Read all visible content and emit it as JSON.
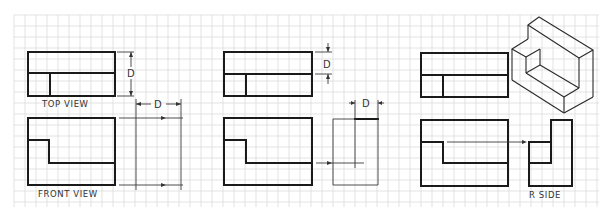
{
  "diagram": {
    "colors": {
      "line": "#1a1a1a",
      "thin_line": "#3a3a3a",
      "grid": "#dcdcdc",
      "background": "#ffffff",
      "text": "#333333"
    },
    "grid": {
      "x0": 14,
      "y0": 15,
      "x1": 599,
      "y1": 207,
      "spacing": 11
    },
    "labels": {
      "top_view": "TOP VIEW",
      "front_view": "FRONT VIEW",
      "r_side": "R SIDE",
      "dim_d1": "D",
      "dim_d2": "D",
      "dim_d3": "D",
      "dim_d4": "D"
    },
    "steps": [
      {
        "id": "step-1",
        "description": "Transfer depth D from top view",
        "top_view": {
          "x": 28,
          "y": 52,
          "w": 87,
          "h": 44,
          "mid_y": 73,
          "inner_x": 50
        },
        "front_view": {
          "x": 28,
          "y": 118,
          "w": 87,
          "h": 67,
          "step_y": 140,
          "step_x": 49,
          "lower_y": 163
        }
      },
      {
        "id": "step-2",
        "description": "Project step depth to side view",
        "top_view": {
          "x": 224,
          "y": 52,
          "w": 88,
          "h": 44,
          "mid_y": 74,
          "inner_x": 246
        },
        "front_view": {
          "x": 224,
          "y": 118,
          "w": 88,
          "h": 67,
          "step_y": 140,
          "step_x": 246,
          "lower_y": 163
        }
      },
      {
        "id": "step-3",
        "description": "Completed right side view with isometric pictorial",
        "top_view": {
          "x": 421,
          "y": 53,
          "w": 87,
          "h": 44,
          "mid_y": 75,
          "inner_x": 443
        },
        "front_view": {
          "x": 421,
          "y": 120,
          "w": 87,
          "h": 66,
          "step_y": 142,
          "step_x": 443,
          "lower_y": 163
        }
      }
    ]
  }
}
